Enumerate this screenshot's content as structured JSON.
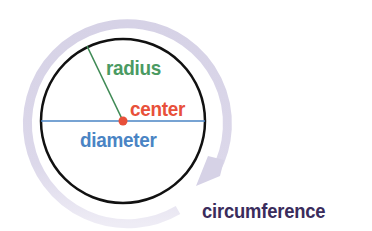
{
  "diagram": {
    "labels": {
      "radius": "radius",
      "center": "center",
      "diameter": "diameter",
      "circumference": "circumference"
    },
    "colors": {
      "radius": "#4a9a62",
      "center": "#e8503a",
      "diameter": "#4a84c4",
      "circumference": "#3a2c5c",
      "circle_outline": "#111111",
      "circumference_arrow": "#d6d2e6"
    },
    "icons": {
      "circumference_arrow": "curved-arrow-icon",
      "center_point": "dot-icon"
    }
  }
}
